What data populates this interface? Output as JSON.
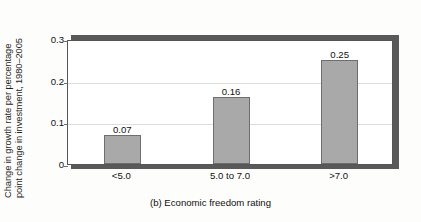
{
  "chart_data": {
    "type": "bar",
    "title": "",
    "caption": "(b) Economic freedom rating",
    "xlabel": "Economic freedom rating",
    "ylabel": "Change in growth rate per percentage point change in investment, 1980–2005",
    "ylabel_lines": [
      "Change in growth rate per percentage",
      "point change in investment, 1980–2005"
    ],
    "categories": [
      "<5.0",
      "5.0 to 7.0",
      ">7.0"
    ],
    "values": [
      0.07,
      0.16,
      0.25
    ],
    "value_labels": [
      "0.07",
      "0.16",
      "0.25"
    ],
    "ylim": [
      0,
      0.3
    ],
    "yticks": [
      0,
      0.1,
      0.2,
      0.3
    ],
    "ytick_labels": [
      "0",
      "0.1",
      "0.2",
      "0.3"
    ],
    "grid": true,
    "gridlines_at": [
      0.1,
      0.2
    ],
    "legend": null,
    "bar_color": "#a9a9a9",
    "bar_edge_color": "#6e6e6e",
    "frame_color": "#555555",
    "shadow_color": "#595959",
    "background_color": "#ffffff"
  }
}
